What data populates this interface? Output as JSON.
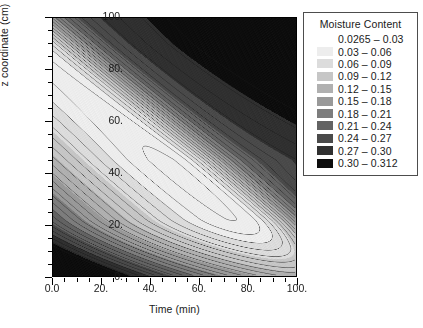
{
  "chart_data": {
    "type": "heatmap",
    "title": "",
    "xlabel": "Time (min)",
    "ylabel": "z coordinate (cm)",
    "xlim": [
      0,
      100
    ],
    "ylim": [
      0,
      100
    ],
    "grid": false,
    "legend_position": "right",
    "x_ticks": [
      {
        "value": 0,
        "label": "0.0"
      },
      {
        "value": 20,
        "label": "20."
      },
      {
        "value": 40,
        "label": "40."
      },
      {
        "value": 60,
        "label": "60."
      },
      {
        "value": 80,
        "label": "80."
      },
      {
        "value": 100,
        "label": "100."
      }
    ],
    "x_minor_ticks": [
      5,
      10,
      15,
      25,
      30,
      35,
      45,
      50,
      55,
      65,
      70,
      75,
      85,
      90,
      95
    ],
    "y_ticks": [
      {
        "value": 0,
        "label": "0."
      },
      {
        "value": 20,
        "label": "20."
      },
      {
        "value": 40,
        "label": "40."
      },
      {
        "value": 60,
        "label": "60."
      },
      {
        "value": 80,
        "label": "80."
      },
      {
        "value": 100,
        "label": "100."
      }
    ],
    "y_minor_ticks": [
      5,
      10,
      15,
      25,
      30,
      35,
      45,
      50,
      55,
      65,
      70,
      75,
      85,
      90,
      95
    ],
    "colorbar_title": "Moisture Content",
    "colorbar_levels": [
      0.0265,
      0.03,
      0.06,
      0.09,
      0.12,
      0.15,
      0.18,
      0.21,
      0.24,
      0.27,
      0.3,
      0.312
    ],
    "colorbar_entries": [
      {
        "label": "0.0265 – 0.03",
        "color": "#ffffff",
        "min": 0.0265,
        "max": 0.03
      },
      {
        "label": "0.03 – 0.06",
        "color": "#ededed",
        "min": 0.03,
        "max": 0.06
      },
      {
        "label": "0.06 – 0.09",
        "color": "#dcdcdc",
        "min": 0.06,
        "max": 0.09
      },
      {
        "label": "0.09 – 0.12",
        "color": "#c6c6c6",
        "min": 0.09,
        "max": 0.12
      },
      {
        "label": "0.12 – 0.15",
        "color": "#b0b0b0",
        "min": 0.12,
        "max": 0.15
      },
      {
        "label": "0.15 – 0.18",
        "color": "#999999",
        "min": 0.15,
        "max": 0.18
      },
      {
        "label": "0.18 – 0.21",
        "color": "#7d7d7d",
        "min": 0.18,
        "max": 0.21
      },
      {
        "label": "0.21 – 0.24",
        "color": "#636363",
        "min": 0.21,
        "max": 0.24
      },
      {
        "label": "0.24 – 0.27",
        "color": "#4a4a4a",
        "min": 0.24,
        "max": 0.27
      },
      {
        "label": "0.27 – 0.30",
        "color": "#303030",
        "min": 0.27,
        "max": 0.3
      },
      {
        "label": "0.30 – 0.312",
        "color": "#0d0d0d",
        "min": 0.3,
        "max": 0.312
      }
    ],
    "contour_line_color": "#1a1a1a"
  }
}
